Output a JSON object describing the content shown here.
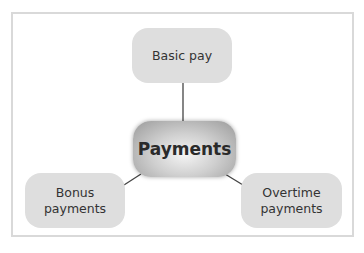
{
  "diagram": {
    "center": {
      "label": "Payments"
    },
    "nodes": [
      {
        "label": "Basic pay"
      },
      {
        "label": "Bonus\npayments",
        "line1": "Bonus",
        "line2": "payments"
      },
      {
        "label": "Overtime\npayments",
        "line1": "Overtime",
        "line2": "payments"
      }
    ],
    "colors": {
      "leaf": "#dedede",
      "border": "#d9d9d9",
      "line": "#444444"
    }
  }
}
